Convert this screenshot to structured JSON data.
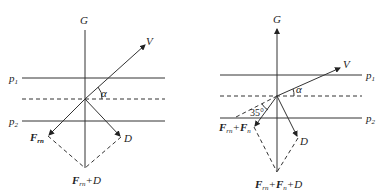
{
  "left_diagram": {
    "axis_label": "G",
    "velocity_label": "V",
    "plane_top_label": "p",
    "plane_top_sub": "1",
    "plane_bottom_label": "p",
    "plane_bottom_sub": "2",
    "angle_label": "α",
    "force_label": "F",
    "force_sub": "rn",
    "drag_label": "D",
    "resultant_label_F": "F",
    "resultant_sub": "rn",
    "resultant_rest": "+D"
  },
  "right_diagram": {
    "axis_label": "G",
    "velocity_label": "V",
    "plane_top_label": "p",
    "plane_top_sub": "1",
    "plane_bottom_label": "p",
    "plane_bottom_sub": "2",
    "angle_label": "α",
    "angle_value": "35°",
    "force_label_1": "F",
    "force_sub_1": "rn",
    "force_plus": "+",
    "force_label_2": "F",
    "force_sub_2": "n",
    "drag_label": "D",
    "resultant_label_1": "F",
    "resultant_sub_1": "rn",
    "resultant_plus": "+",
    "resultant_label_2": "F",
    "resultant_sub_2": "n",
    "resultant_rest": "+D"
  }
}
